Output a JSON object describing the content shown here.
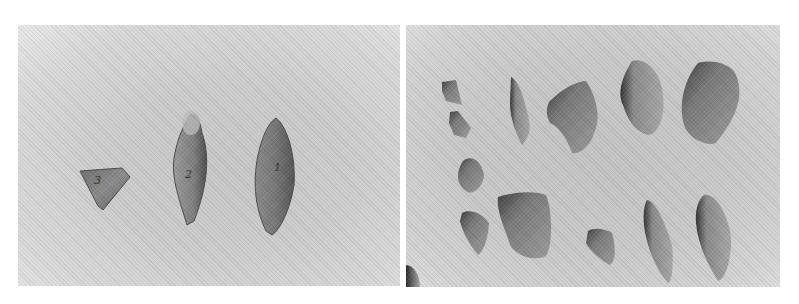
{
  "figure": {
    "panels": [
      {
        "id": "left",
        "description": "Three stone points on a light grey background",
        "artifacts": [
          {
            "label": "3",
            "shape": "triangular"
          },
          {
            "label": "2",
            "shape": "leaf-shaped"
          },
          {
            "label": "1",
            "shape": "leaf-shaped"
          }
        ]
      },
      {
        "id": "right",
        "description": "Thirteen stone flakes arranged in two rows on a grey background",
        "artifact_count": 13
      }
    ],
    "colors": {
      "page_background": "#ffffff",
      "left_backdrop": "#cdcdcd",
      "right_backdrop": "#c9c9c9",
      "stone_dark": "#3a3a3a",
      "stone_mid": "#8a8a8a",
      "stone_light": "#b5b5b5"
    }
  }
}
